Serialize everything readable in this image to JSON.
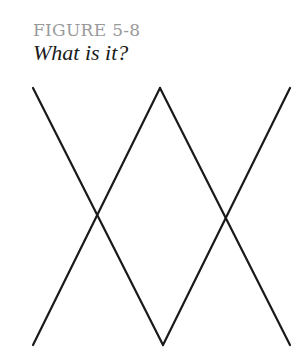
{
  "figure": {
    "label": "FIGURE 5-8",
    "caption": "What is it?"
  },
  "drawing": {
    "stroke_color": "#1a1a1a",
    "lines": [
      {
        "x1": 33,
        "y1": 88,
        "x2": 163,
        "y2": 345
      },
      {
        "x1": 163,
        "y1": 345,
        "x2": 290,
        "y2": 88
      },
      {
        "x1": 33,
        "y1": 345,
        "x2": 160,
        "y2": 88
      },
      {
        "x1": 160,
        "y1": 88,
        "x2": 290,
        "y2": 345
      }
    ]
  }
}
